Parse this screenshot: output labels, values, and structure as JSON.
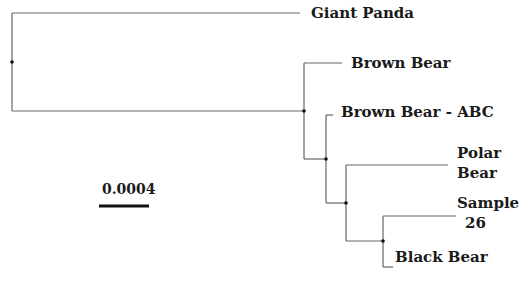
{
  "figure": {
    "type": "phylogenetic-tree",
    "line_color": "#555555",
    "node_color": "#111111",
    "text_color": "#1a1a1a"
  },
  "scale_bar": {
    "label": "0.0004"
  },
  "taxa": [
    {
      "id": "giant-panda",
      "label": "Giant Panda"
    },
    {
      "id": "brown-bear",
      "label": "Brown Bear"
    },
    {
      "id": "brown-bear-abc",
      "label": "Brown Bear - ABC"
    },
    {
      "id": "polar-bear",
      "label": "Polar Bear",
      "lines": [
        "Polar",
        "Bear"
      ]
    },
    {
      "id": "sample-26",
      "label": "Sample 26",
      "lines": [
        "Sample",
        "26"
      ]
    },
    {
      "id": "black-bear",
      "label": "Black Bear"
    }
  ],
  "topology": "(Giant Panda,(Brown Bear,(Brown Bear - ABC,(Polar Bear,(Sample 26,Black Bear)))))"
}
